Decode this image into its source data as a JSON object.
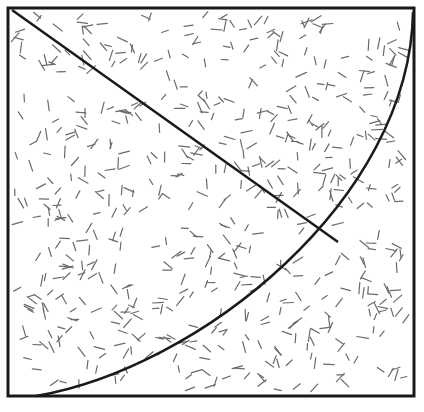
{
  "figure": {
    "square": {
      "x": 8,
      "y": 8,
      "width": 406,
      "height": 388,
      "stroke": "#1a1a1a",
      "stroke_width": 3
    },
    "diagonal_line": {
      "x1": 12,
      "y1": 10,
      "x2": 338,
      "y2": 242,
      "stroke": "#1a1a1a",
      "stroke_width": 2.5
    },
    "arc": {
      "start": [
        36,
        396
      ],
      "end": [
        413,
        12
      ],
      "control1": [
        200,
        368
      ],
      "control2": [
        410,
        200
      ],
      "stroke": "#1a1a1a",
      "stroke_width": 2.5
    },
    "texture": {
      "dash_color": "#6a6a6a",
      "dash_length": 9,
      "dash_count": 620
    }
  },
  "caption": {
    "text": "",
    "clipped": true
  }
}
